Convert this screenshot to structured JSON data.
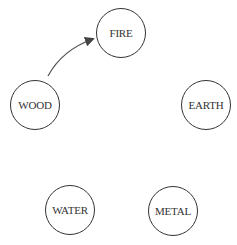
{
  "diagram": {
    "nodes": [
      {
        "id": "fire",
        "label": "FIRE",
        "cx": 121,
        "cy": 33,
        "r": 25
      },
      {
        "id": "wood",
        "label": "WOOD",
        "cx": 35,
        "cy": 105,
        "r": 25
      },
      {
        "id": "earth",
        "label": "EARTH",
        "cx": 206,
        "cy": 105,
        "r": 25
      },
      {
        "id": "water",
        "label": "WATER",
        "cx": 70,
        "cy": 210,
        "r": 25
      },
      {
        "id": "metal",
        "label": "METAL",
        "cx": 173,
        "cy": 211,
        "r": 25
      }
    ],
    "edges": [
      {
        "from": "wood",
        "to": "fire",
        "style": "curved-arrow"
      }
    ],
    "colors": {
      "stroke": "#333333",
      "background": "#ffffff"
    }
  }
}
